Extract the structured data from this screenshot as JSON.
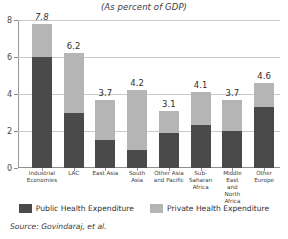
{
  "chart_data": {
    "type": "bar",
    "title": "(As percent of GDP)",
    "subtitle": "",
    "xlabel": "",
    "ylabel": "",
    "ylim": [
      0,
      8
    ],
    "yticks": [
      "0",
      "2",
      "4",
      "6",
      "8"
    ],
    "grid": true,
    "stacked": true,
    "legend_position": "bottom",
    "categories": [
      "Industrial Economies",
      "LAC",
      "East Asia",
      "South Asia",
      "Other Asia and Pacific",
      "Sub-Saharan Africa",
      "Middle East and North Africa",
      "Other Europe"
    ],
    "category_lines": [
      [
        "Industrial",
        "Economies"
      ],
      [
        "LAC"
      ],
      [
        "East Asia"
      ],
      [
        "South",
        "Asia"
      ],
      [
        "Other Asia",
        "and Pacific"
      ],
      [
        "Sub-",
        "Saharan",
        "Africa"
      ],
      [
        "Middle East",
        "and",
        "North Africa"
      ],
      [
        "Other",
        "Europe"
      ]
    ],
    "totals": [
      7.8,
      6.2,
      3.7,
      4.2,
      3.1,
      4.1,
      3.7,
      4.6
    ],
    "total_labels": [
      "7.8",
      "6.2",
      "3.7",
      "4.2",
      "3.1",
      "4.1",
      "3.7",
      "4.6"
    ],
    "series": [
      {
        "name": "Public Health Expenditure",
        "color": "#4a4a4a",
        "values": [
          6.0,
          3.0,
          1.5,
          1.0,
          1.9,
          2.3,
          2.0,
          3.3
        ]
      },
      {
        "name": "Private Health Expenditure",
        "color": "#b5b5b5",
        "values": [
          1.8,
          3.2,
          2.2,
          3.2,
          1.2,
          1.8,
          1.7,
          1.3
        ]
      }
    ]
  },
  "legend": [
    {
      "label": "Public Health Expenditure",
      "color": "#4a4a4a",
      "swatch_name": "legend-swatch-public"
    },
    {
      "label": "Private Health Expenditure",
      "color": "#b5b5b5",
      "swatch_name": "legend-swatch-private"
    }
  ],
  "source": {
    "text": "Source: Govindaraj, et al."
  }
}
